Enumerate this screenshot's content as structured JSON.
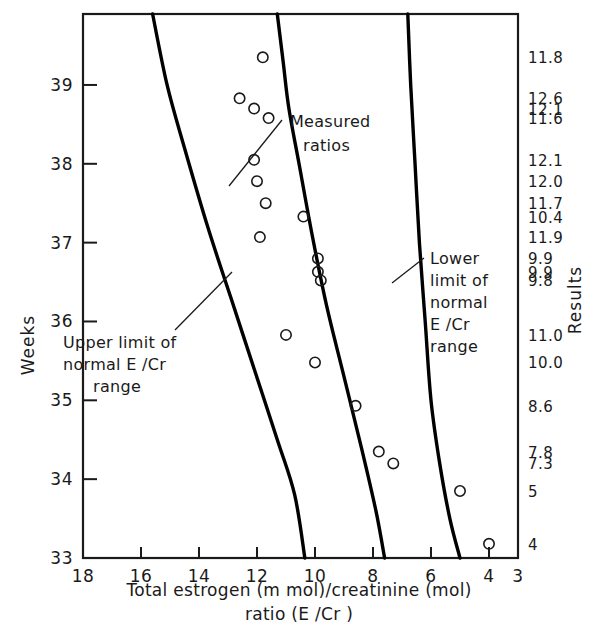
{
  "chart_data": {
    "type": "scatter",
    "title": "",
    "xlabel_line1": "Total estrogen (m mol)/creatinine  (mol)",
    "xlabel_line2": "ratio (E /Cr )",
    "ylabel": "Weeks",
    "right_axis_label": "Results",
    "grid": false,
    "x_axis_reversed": true,
    "xlim": [
      18,
      3
    ],
    "ylim": [
      33,
      39.9
    ],
    "x_ticks": [
      18,
      16,
      14,
      12,
      10,
      8,
      6,
      4,
      3
    ],
    "x_tick_labels": [
      "18",
      "16",
      "14",
      "12",
      "10",
      "8",
      "6",
      "4",
      "3"
    ],
    "y_ticks": [
      33,
      34,
      35,
      36,
      37,
      38,
      39
    ],
    "y_tick_labels": [
      "33",
      "34",
      "35",
      "36",
      "37",
      "38",
      "39"
    ],
    "series": [
      {
        "name": "Measured ratios",
        "marker": "open-circle",
        "points": [
          {
            "x": 11.8,
            "y": 39.35,
            "result": "11.8"
          },
          {
            "x": 12.6,
            "y": 38.83,
            "result": "12.6"
          },
          {
            "x": 12.1,
            "y": 38.7,
            "result": "12.1"
          },
          {
            "x": 11.6,
            "y": 38.58,
            "result": "11.6"
          },
          {
            "x": 12.1,
            "y": 38.05,
            "result": "12.1"
          },
          {
            "x": 12.0,
            "y": 37.78,
            "result": "12.0"
          },
          {
            "x": 11.7,
            "y": 37.5,
            "result": "11.7"
          },
          {
            "x": 10.4,
            "y": 37.33,
            "result": "10.4"
          },
          {
            "x": 11.9,
            "y": 37.07,
            "result": "11.9"
          },
          {
            "x": 9.9,
            "y": 36.8,
            "result": "9.9"
          },
          {
            "x": 9.9,
            "y": 36.63,
            "result": "9.9"
          },
          {
            "x": 9.8,
            "y": 36.52,
            "result": "9.8"
          },
          {
            "x": 11.0,
            "y": 35.83,
            "result": "11.0"
          },
          {
            "x": 10.0,
            "y": 35.48,
            "result": "10.0"
          },
          {
            "x": 8.6,
            "y": 34.93,
            "result": "8.6"
          },
          {
            "x": 7.8,
            "y": 34.35,
            "result": "7.8"
          },
          {
            "x": 7.3,
            "y": 34.2,
            "result": "7.3"
          },
          {
            "x": 5.0,
            "y": 33.85,
            "result": "5"
          },
          {
            "x": 4.0,
            "y": 33.18,
            "result": "4"
          }
        ]
      }
    ],
    "curves": [
      {
        "name": "Upper limit of normal E /Cr range",
        "annotation": [
          "Upper limit of",
          "normal E /Cr",
          "range"
        ],
        "points": [
          [
            15.6,
            39.9
          ],
          [
            15.1,
            39.0
          ],
          [
            14.5,
            38.2
          ],
          [
            13.7,
            37.2
          ],
          [
            12.9,
            36.3
          ],
          [
            12.1,
            35.4
          ],
          [
            11.3,
            34.5
          ],
          [
            10.7,
            33.8
          ],
          [
            10.35,
            33.0
          ]
        ]
      },
      {
        "name": "Measured ratios guide curve",
        "annotation": [
          "Measured",
          "ratios"
        ],
        "points": [
          [
            11.3,
            39.9
          ],
          [
            11.1,
            39.3
          ],
          [
            10.9,
            38.7
          ],
          [
            10.55,
            38.0
          ],
          [
            10.1,
            37.1
          ],
          [
            9.6,
            36.2
          ],
          [
            9.0,
            35.3
          ],
          [
            8.4,
            34.4
          ],
          [
            7.9,
            33.6
          ],
          [
            7.6,
            33.0
          ]
        ]
      },
      {
        "name": "Lower limit of normal E /Cr range",
        "annotation": [
          "Lower",
          "limit of",
          "normal",
          "E /Cr",
          "range"
        ],
        "points": [
          [
            6.8,
            39.9
          ],
          [
            6.7,
            39.0
          ],
          [
            6.55,
            38.0
          ],
          [
            6.4,
            37.0
          ],
          [
            6.2,
            36.0
          ],
          [
            6.0,
            35.0
          ],
          [
            5.7,
            34.2
          ],
          [
            5.35,
            33.5
          ],
          [
            5.0,
            33.0
          ]
        ]
      }
    ],
    "results_column": [
      "11.8",
      "12.6",
      "12.1",
      "11.6",
      "12.1",
      "12.0",
      "11.7",
      "10.4",
      "11.9",
      "9.9",
      "9.9",
      "9.8",
      "11.0",
      "10.0",
      "8.6",
      "7.8",
      "7.3",
      "5",
      "4"
    ],
    "colors": {
      "ink": "#1a1a1a",
      "axis": "#1a1a1a",
      "curve": "#000000",
      "marker": "#1a1a1a",
      "background": "#ffffff"
    }
  }
}
